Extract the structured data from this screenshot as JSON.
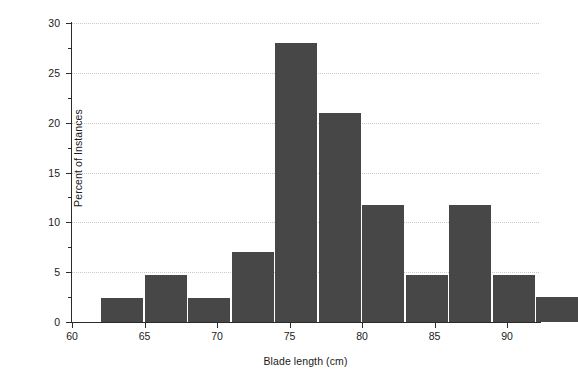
{
  "chart_data": {
    "type": "bar",
    "title": "",
    "xlabel": "Blade length (cm)",
    "ylabel": "Percent of Instances",
    "xlim": [
      60,
      92.2
    ],
    "ylim": [
      0,
      30
    ],
    "grid": true,
    "legend": null,
    "bin_width": 3,
    "xticks": [
      60,
      65,
      70,
      75,
      80,
      85,
      90
    ],
    "xtick_labels": [
      "60",
      "65",
      "70",
      "75",
      "80",
      "85",
      "90"
    ],
    "yticks": [
      0,
      5,
      10,
      15,
      20,
      25,
      30
    ],
    "ytick_labels": [
      "0",
      "5",
      "10",
      "15",
      "20",
      "25",
      "30"
    ],
    "yticks_minor": [
      2.5,
      7.5,
      12.5,
      17.5,
      22.5,
      27.5
    ],
    "bar_color": "#474747",
    "grid_color": "#c9c9c9",
    "axis_color": "#2b2b2b",
    "bins": [
      {
        "x0": 62,
        "x1": 65,
        "value": 2.4
      },
      {
        "x0": 65,
        "x1": 68,
        "value": 4.7
      },
      {
        "x0": 68,
        "x1": 71,
        "value": 2.4
      },
      {
        "x0": 71,
        "x1": 74,
        "value": 7.0
      },
      {
        "x0": 74,
        "x1": 77,
        "value": 28.0
      },
      {
        "x0": 77,
        "x1": 80,
        "value": 21.0
      },
      {
        "x0": 80,
        "x1": 83,
        "value": 11.7
      },
      {
        "x0": 83,
        "x1": 86,
        "value": 4.7
      },
      {
        "x0": 86,
        "x1": 89,
        "value": 11.7
      },
      {
        "x0": 89,
        "x1": 92,
        "value": 4.7
      },
      {
        "x0": 92,
        "x1": 95,
        "value": 2.5
      }
    ],
    "categories": [
      "62-65",
      "65-68",
      "68-71",
      "71-74",
      "74-77",
      "77-80",
      "80-83",
      "83-86",
      "86-89",
      "89-92",
      "92-95"
    ],
    "values": [
      2.4,
      4.7,
      2.4,
      7.0,
      28.0,
      21.0,
      11.7,
      4.7,
      11.7,
      4.7,
      2.5
    ]
  }
}
